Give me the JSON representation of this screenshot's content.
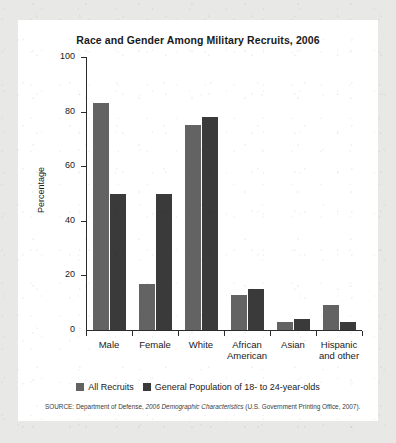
{
  "figure": {
    "title": "Race and Gender Among Military Recruits, 2006",
    "source_prefix": "SOURCE: Department of Defense, ",
    "source_italic": "2006 Demographic Characteristics",
    "source_suffix": " (U.S. Government Printing Office, 2007)."
  },
  "colors": {
    "series_light": "#636363",
    "series_dark": "#3a3a3a",
    "axis": "#2b2b2b",
    "card_background": "#ffffff",
    "page_background": "#e8e8e6"
  },
  "chart_data": {
    "type": "bar",
    "title": "Race and Gender Among Military Recruits, 2006",
    "xlabel": "",
    "ylabel": "Percentage",
    "ylim": [
      0,
      100
    ],
    "yticks": [
      0,
      20,
      40,
      60,
      80,
      100
    ],
    "ytick_labels": [
      "0",
      "20",
      "40",
      "60",
      "80",
      "100"
    ],
    "grid": false,
    "legend_position": "bottom",
    "categories": [
      "Male",
      "Female",
      "White",
      "African American",
      "Asian",
      "Hispanic and other"
    ],
    "category_lines": [
      [
        "Male"
      ],
      [
        "Female"
      ],
      [
        "White"
      ],
      [
        "African",
        "American"
      ],
      [
        "Asian"
      ],
      [
        "Hispanic",
        "and other"
      ]
    ],
    "series": [
      {
        "name": "All Recruits",
        "color": "#636363",
        "values": [
          83,
          17,
          75,
          13,
          3,
          9
        ]
      },
      {
        "name": "General Population of 18- to 24-year-olds",
        "color": "#3a3a3a",
        "values": [
          50,
          50,
          78,
          15,
          4,
          3
        ]
      }
    ]
  }
}
